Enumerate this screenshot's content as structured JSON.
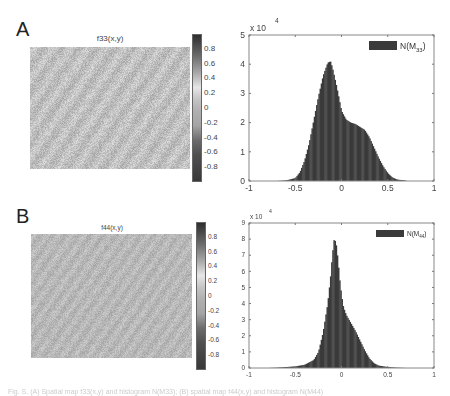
{
  "figure": {
    "panels": [
      {
        "letter": "A",
        "image": {
          "title": "f33(x,y)",
          "colorbar_ticks": [
            "0.8",
            "0.6",
            "0.4",
            "0.2",
            "0",
            "-0.2",
            "-0.4",
            "-0.6",
            "-0.8"
          ],
          "colorbar_range": [
            -1,
            1
          ]
        },
        "histogram": {
          "exponent_label": "x 10",
          "exponent_power": "4",
          "legend_label": "N(M",
          "legend_sub": "33",
          "legend_close": ")"
        }
      },
      {
        "letter": "B",
        "image": {
          "title": "f44(x,y)",
          "colorbar_ticks": [
            "0.8",
            "0.6",
            "0.4",
            "0.2",
            "0",
            "-0.2",
            "-0.4",
            "-0.6",
            "-0.8"
          ],
          "colorbar_range": [
            -1,
            1
          ]
        },
        "histogram": {
          "exponent_label": "x 10",
          "exponent_power": "4",
          "legend_label": "N(M",
          "legend_sub": "44",
          "legend_close": ")"
        }
      }
    ],
    "caption": "Fig. S. (A) Spatial map f33(x,y) and histogram N(M33); (B) spatial map f44(x,y) and histogram N(M44)"
  },
  "colors": {
    "bar_fill": "#3a3a3a",
    "axis": "#888888",
    "image_base": "#b8b8b8",
    "background": "#ffffff"
  },
  "chart_data": [
    {
      "type": "heatmap",
      "title": "f33(x,y)",
      "colorbar": {
        "range": [
          -1,
          1
        ],
        "ticks": [
          0.8,
          0.6,
          0.4,
          0.2,
          0,
          -0.2,
          -0.4,
          -0.6,
          -0.8
        ]
      },
      "note": "Spatial texture map, values mostly near 0 (light gray)"
    },
    {
      "type": "bar",
      "title": "",
      "legend": [
        "N(M33)"
      ],
      "xlabel": "",
      "ylabel": "",
      "xlim": [
        -1,
        1
      ],
      "ylim": [
        0,
        5
      ],
      "y_multiplier": "x 10^4",
      "xticks": [
        -1,
        -0.5,
        0,
        0.5,
        1
      ],
      "yticks": [
        0,
        1,
        2,
        3,
        4,
        5
      ],
      "x": [
        -0.7,
        -0.6,
        -0.5,
        -0.45,
        -0.4,
        -0.35,
        -0.3,
        -0.25,
        -0.2,
        -0.15,
        -0.12,
        -0.1,
        -0.05,
        0,
        0.05,
        0.1,
        0.15,
        0.2,
        0.25,
        0.3,
        0.35,
        0.4,
        0.45,
        0.5,
        0.55,
        0.6,
        0.7
      ],
      "values": [
        0.0,
        0.02,
        0.1,
        0.3,
        0.7,
        1.3,
        2.1,
        2.9,
        3.6,
        4.05,
        4.1,
        3.9,
        3.2,
        2.4,
        2.1,
        2.0,
        1.95,
        1.85,
        1.75,
        1.5,
        1.15,
        0.8,
        0.5,
        0.27,
        0.12,
        0.05,
        0.01
      ]
    },
    {
      "type": "heatmap",
      "title": "f44(x,y)",
      "colorbar": {
        "range": [
          -1,
          1
        ],
        "ticks": [
          0.8,
          0.6,
          0.4,
          0.2,
          0,
          -0.2,
          -0.4,
          -0.6,
          -0.8
        ]
      },
      "note": "Spatial texture map, values mostly near 0 (gray), finer texture"
    },
    {
      "type": "bar",
      "title": "",
      "legend": [
        "N(M44)"
      ],
      "xlabel": "",
      "ylabel": "",
      "xlim": [
        -1,
        1
      ],
      "ylim": [
        0,
        9
      ],
      "y_multiplier": "x 10^4",
      "xticks": [
        -1,
        -0.5,
        0,
        0.5,
        1
      ],
      "yticks": [
        0,
        1,
        2,
        3,
        4,
        5,
        6,
        7,
        8,
        9
      ],
      "x": [
        -0.8,
        -0.7,
        -0.5,
        -0.4,
        -0.3,
        -0.25,
        -0.2,
        -0.15,
        -0.12,
        -0.1,
        -0.08,
        -0.06,
        -0.04,
        -0.02,
        0,
        0.02,
        0.05,
        0.1,
        0.15,
        0.2,
        0.25,
        0.3,
        0.35,
        0.4,
        0.5,
        0.6,
        0.7
      ],
      "values": [
        0.0,
        0.02,
        0.1,
        0.2,
        0.5,
        1.0,
        2.2,
        4.0,
        5.6,
        7.0,
        8.0,
        7.8,
        6.8,
        5.5,
        4.5,
        3.8,
        3.3,
        2.8,
        2.3,
        1.7,
        1.1,
        0.6,
        0.3,
        0.15,
        0.06,
        0.02,
        0.0
      ]
    }
  ]
}
